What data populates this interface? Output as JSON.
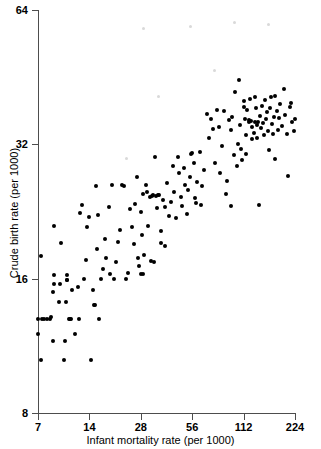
{
  "figure": {
    "title": "",
    "background_color": "#ffffff",
    "point_color": "#000000",
    "axis_color": "#4d4d4d"
  },
  "chart_data": {
    "type": "scatter",
    "title": "",
    "subtitle": "",
    "xlabel": "Infant mortality rate (per 1000)",
    "ylabel": "Crude birth rate (per 1000)",
    "xscale": "log",
    "yscale": "log",
    "xlim": [
      7,
      224
    ],
    "ylim": [
      8,
      64
    ],
    "xticks": [
      7,
      14,
      28,
      56,
      112,
      224
    ],
    "xtick_labels": [
      "7",
      "14",
      "28",
      "56",
      "112",
      "224"
    ],
    "yticks": [
      8,
      16,
      32,
      64
    ],
    "ytick_labels": [
      "8",
      "16",
      "32",
      "64"
    ],
    "grid": false,
    "legend": null,
    "annotations": [],
    "n_points": 188,
    "points": [
      [
        7.0,
        12.0
      ],
      [
        7.3,
        10.5
      ],
      [
        7.3,
        18.0
      ],
      [
        7.0,
        13.0
      ],
      [
        7.4,
        13.0
      ],
      [
        7.6,
        13.0
      ],
      [
        7.9,
        13.0
      ],
      [
        8.2,
        13.0
      ],
      [
        8.3,
        13.1
      ],
      [
        8.6,
        11.6
      ],
      [
        8.6,
        14.9
      ],
      [
        8.7,
        15.6
      ],
      [
        8.7,
        16.3
      ],
      [
        8.7,
        21.0
      ],
      [
        9.3,
        14.2
      ],
      [
        9.4,
        15.6
      ],
      [
        9.6,
        19.2
      ],
      [
        10.0,
        10.5
      ],
      [
        10.1,
        11.6
      ],
      [
        10.2,
        14.2
      ],
      [
        10.3,
        15.9
      ],
      [
        10.4,
        15.9
      ],
      [
        10.4,
        16.3
      ],
      [
        10.6,
        13.0
      ],
      [
        10.8,
        13.0
      ],
      [
        10.9,
        13.0
      ],
      [
        11.1,
        15.1
      ],
      [
        11.6,
        12.0
      ],
      [
        12.0,
        15.3
      ],
      [
        12.2,
        13.0
      ],
      [
        12.4,
        22.4
      ],
      [
        12.6,
        23.4
      ],
      [
        13.0,
        16.0
      ],
      [
        13.3,
        17.6
      ],
      [
        13.5,
        20.9
      ],
      [
        14.0,
        22.0
      ],
      [
        14.3,
        10.5
      ],
      [
        14.6,
        15.1
      ],
      [
        14.8,
        14.0
      ],
      [
        15.0,
        14.0
      ],
      [
        15.3,
        25.8
      ],
      [
        15.6,
        18.6
      ],
      [
        15.8,
        22.2
      ],
      [
        16.0,
        13.0
      ],
      [
        16.4,
        16.0
      ],
      [
        16.8,
        16.8
      ],
      [
        17.2,
        19.6
      ],
      [
        17.6,
        17.8
      ],
      [
        18.2,
        23.1
      ],
      [
        18.6,
        16.4
      ],
      [
        19.0,
        25.9
      ],
      [
        19.4,
        16.0
      ],
      [
        20.0,
        17.4
      ],
      [
        20.6,
        19.3
      ],
      [
        21.2,
        20.6
      ],
      [
        21.8,
        25.9
      ],
      [
        22.4,
        25.8
      ],
      [
        23.0,
        16.0
      ],
      [
        23.6,
        16.5
      ],
      [
        24.2,
        22.9
      ],
      [
        25.0,
        20.9
      ],
      [
        25.5,
        19.1
      ],
      [
        26.0,
        23.5
      ],
      [
        26.6,
        27.0
      ],
      [
        27.0,
        17.8
      ],
      [
        27.4,
        17.1
      ],
      [
        28.0,
        22.6
      ],
      [
        28.2,
        16.4
      ],
      [
        28.4,
        20.0
      ],
      [
        28.8,
        16.4
      ],
      [
        29.0,
        24.8
      ],
      [
        29.4,
        18.1
      ],
      [
        30.0,
        25.9
      ],
      [
        30.4,
        25.0
      ],
      [
        31.0,
        21.0
      ],
      [
        31.6,
        24.4
      ],
      [
        32.0,
        17.5
      ],
      [
        32.4,
        24.5
      ],
      [
        33.0,
        24.6
      ],
      [
        33.4,
        17.4
      ],
      [
        34.0,
        30.0
      ],
      [
        34.6,
        24.5
      ],
      [
        35.0,
        23.0
      ],
      [
        35.5,
        24.6
      ],
      [
        36.0,
        24.6
      ],
      [
        36.6,
        20.5
      ],
      [
        37.0,
        19.2
      ],
      [
        38.0,
        24.0
      ],
      [
        38.6,
        18.9
      ],
      [
        39.0,
        23.1
      ],
      [
        40.0,
        26.2
      ],
      [
        41.0,
        22.1
      ],
      [
        42.0,
        23.8
      ],
      [
        43.0,
        28.6
      ],
      [
        44.0,
        25.0
      ],
      [
        45.0,
        21.9
      ],
      [
        46.0,
        30.0
      ],
      [
        47.0,
        27.6
      ],
      [
        48.0,
        24.4
      ],
      [
        49.0,
        23.3
      ],
      [
        50.0,
        28.3
      ],
      [
        51.0,
        26.0
      ],
      [
        52.0,
        22.3
      ],
      [
        53.0,
        25.3
      ],
      [
        54.0,
        27.0
      ],
      [
        55.0,
        30.5
      ],
      [
        56.0,
        30.6
      ],
      [
        57.0,
        29.0
      ],
      [
        58.0,
        24.2
      ],
      [
        59.0,
        23.7
      ],
      [
        60.0,
        26.3
      ],
      [
        62.0,
        30.8
      ],
      [
        63.0,
        23.4
      ],
      [
        64.0,
        25.8
      ],
      [
        66.0,
        28.1
      ],
      [
        68.0,
        37.4
      ],
      [
        70.0,
        33.0
      ],
      [
        72.0,
        36.5
      ],
      [
        74.0,
        34.6
      ],
      [
        76.0,
        29.0
      ],
      [
        78.0,
        38.3
      ],
      [
        80.0,
        35.0
      ],
      [
        82.0,
        27.6
      ],
      [
        84.0,
        31.7
      ],
      [
        86.0,
        38.0
      ],
      [
        88.0,
        24.8
      ],
      [
        90.0,
        26.5
      ],
      [
        92.0,
        36.3
      ],
      [
        94.0,
        34.4
      ],
      [
        95.0,
        23.3
      ],
      [
        96.0,
        36.9
      ],
      [
        98.0,
        30.3
      ],
      [
        100.0,
        42.0
      ],
      [
        102.0,
        28.6
      ],
      [
        104.0,
        32.0
      ],
      [
        105.0,
        44.6
      ],
      [
        106.0,
        35.4
      ],
      [
        108.0,
        31.3
      ],
      [
        110.0,
        29.5
      ],
      [
        112.0,
        38.8
      ],
      [
        113.0,
        40.0
      ],
      [
        114.0,
        36.4
      ],
      [
        115.0,
        33.6
      ],
      [
        116.0,
        30.4
      ],
      [
        118.0,
        38.2
      ],
      [
        120.0,
        35.9
      ],
      [
        121.0,
        36.2
      ],
      [
        122.0,
        40.5
      ],
      [
        124.0,
        36.1
      ],
      [
        125.0,
        32.9
      ],
      [
        126.0,
        35.0
      ],
      [
        128.0,
        34.0
      ],
      [
        130.0,
        40.8
      ],
      [
        131.0,
        36.0
      ],
      [
        132.0,
        38.6
      ],
      [
        134.0,
        35.3
      ],
      [
        135.0,
        33.1
      ],
      [
        136.0,
        36.0
      ],
      [
        138.0,
        23.4
      ],
      [
        140.0,
        37.0
      ],
      [
        142.0,
        34.8
      ],
      [
        144.0,
        39.0
      ],
      [
        146.0,
        35.8
      ],
      [
        148.0,
        33.5
      ],
      [
        150.0,
        40.2
      ],
      [
        152.0,
        36.4
      ],
      [
        154.0,
        37.8
      ],
      [
        156.0,
        34.2
      ],
      [
        158.0,
        31.0
      ],
      [
        160.0,
        38.5
      ],
      [
        162.0,
        40.9
      ],
      [
        164.0,
        35.5
      ],
      [
        166.0,
        33.7
      ],
      [
        168.0,
        36.8
      ],
      [
        170.0,
        29.6
      ],
      [
        172.0,
        41.0
      ],
      [
        176.0,
        38.0
      ],
      [
        178.0,
        34.5
      ],
      [
        180.0,
        36.6
      ],
      [
        184.0,
        39.5
      ],
      [
        188.0,
        35.2
      ],
      [
        192.0,
        42.5
      ],
      [
        196.0,
        37.3
      ],
      [
        200.0,
        33.8
      ],
      [
        204.0,
        27.2
      ],
      [
        208.0,
        38.7
      ],
      [
        212.0,
        39.6
      ],
      [
        216.0,
        36.0
      ],
      [
        220.0,
        34.2
      ],
      [
        224.0,
        36.4
      ]
    ]
  }
}
